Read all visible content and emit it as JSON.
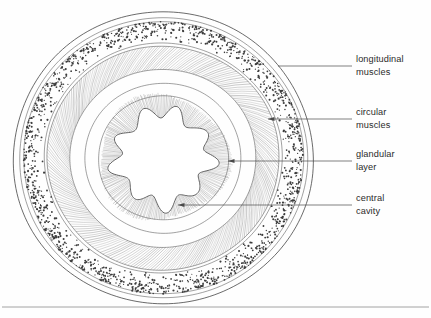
{
  "figure": {
    "type": "anatomical-cross-section",
    "background_color": "#fefefe",
    "ink_color": "#3a3a3a",
    "text_color": "#2b2b2b",
    "leader_color": "#4a4a4a"
  },
  "labels": [
    {
      "id": "longitudinal-muscles",
      "line1": "longitudinal",
      "line2": "muscles",
      "text_x": 356,
      "text_y": 62,
      "leader_from_x": 352,
      "leader_from_y": 66,
      "leader_to_x": 278,
      "leader_to_y": 66,
      "arrow": false
    },
    {
      "id": "circular-muscles",
      "line1": "circular",
      "line2": "muscles",
      "text_x": 356,
      "text_y": 115,
      "leader_from_x": 352,
      "leader_from_y": 119,
      "leader_to_x": 268,
      "leader_to_y": 119,
      "arrow": true
    },
    {
      "id": "glandular-layer",
      "line1": "glandular",
      "line2": "layer",
      "text_x": 356,
      "text_y": 157,
      "leader_from_x": 352,
      "leader_from_y": 161,
      "leader_to_x": 228,
      "leader_to_y": 161,
      "arrow": true
    },
    {
      "id": "central-cavity",
      "line1": "central",
      "line2": "cavity",
      "text_x": 356,
      "text_y": 201,
      "leader_from_x": 352,
      "leader_from_y": 205,
      "leader_to_x": 178,
      "leader_to_y": 205,
      "arrow": true
    }
  ],
  "geometry": {
    "center_x": 163,
    "center_y": 158,
    "rings": [
      {
        "name": "outer-cuticle-outer",
        "rx": 150,
        "ry": 146
      },
      {
        "name": "outer-cuticle-inner",
        "rx": 144,
        "ry": 140
      },
      {
        "name": "stipple-band-outer",
        "rx": 140,
        "ry": 136
      },
      {
        "name": "stipple-band-inner",
        "rx": 119,
        "ry": 115
      },
      {
        "name": "circular-muscle-outer",
        "rx": 116,
        "ry": 112
      },
      {
        "name": "circular-muscle-inner",
        "rx": 93,
        "ry": 89
      },
      {
        "name": "inner-clear-zone",
        "rx": 78,
        "ry": 75
      },
      {
        "name": "glandular-outer",
        "rx": 65,
        "ry": 62
      }
    ],
    "stipple_dot_count": 1500,
    "circular_hatch_count": 230,
    "gland_ray_count": 240
  },
  "cavity": {
    "name": "central-cavity-outline",
    "lobes": 9,
    "base_radius": 47,
    "lobe_amplitude": 6.5
  },
  "footer": {
    "rule_y": 307,
    "rule_x1": 2,
    "rule_x2": 429
  }
}
